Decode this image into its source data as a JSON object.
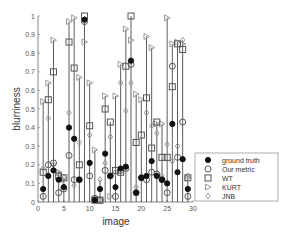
{
  "chart_data": {
    "type": "scatter",
    "title": "",
    "xlabel": "image",
    "ylabel": "blurriness",
    "xlim": [
      0,
      30
    ],
    "ylim": [
      0,
      1
    ],
    "xticks": [
      0,
      5,
      10,
      15,
      20,
      25,
      30
    ],
    "yticks": [
      0,
      0.1,
      0.2,
      0.3,
      0.4,
      0.5,
      0.6,
      0.7,
      0.8,
      0.9,
      1
    ],
    "grid": false,
    "legend_position": "lower right",
    "x": [
      1,
      2,
      3,
      4,
      5,
      6,
      7,
      8,
      9,
      10,
      11,
      12,
      13,
      14,
      15,
      16,
      17,
      18,
      19,
      20,
      21,
      22,
      23,
      24,
      25,
      26,
      27,
      28,
      29
    ],
    "series": [
      {
        "name": "ground truth",
        "marker": "filled-circle",
        "values": [
          0.07,
          0.14,
          0.17,
          0.12,
          0.08,
          0.4,
          0.34,
          0.12,
          0.98,
          0.21,
          0.01,
          0.07,
          0.26,
          0.14,
          0.08,
          0.18,
          0.19,
          0.76,
          0.05,
          0.13,
          0.14,
          0.22,
          0.14,
          0.12,
          0.1,
          0.42,
          0.16,
          0.23,
          0.07
        ]
      },
      {
        "name": "Our metric",
        "marker": "open-circle",
        "values": [
          0.03,
          0.2,
          0.21,
          0.05,
          0.07,
          0.25,
          0.12,
          0.12,
          0.97,
          0.14,
          0.02,
          0.01,
          0.17,
          0.14,
          0.03,
          0.17,
          0.18,
          0.74,
          0.05,
          0.13,
          0.12,
          0.16,
          0.15,
          0.12,
          0.05,
          0.73,
          0.24,
          0.43,
          0.03
        ]
      },
      {
        "name": "WT",
        "marker": "square",
        "values": [
          0.16,
          0.55,
          0.7,
          0.14,
          0.13,
          0.86,
          0.72,
          0.2,
          1.0,
          0.41,
          0.01,
          0.01,
          0.5,
          0.43,
          0.17,
          0.16,
          0.73,
          1.0,
          0.32,
          0.36,
          0.56,
          0.29,
          0.43,
          0.24,
          0.24,
          0.62,
          0.85,
          0.82,
          0.13
        ]
      },
      {
        "name": "KURT",
        "marker": "triangle-right",
        "values": [
          0.54,
          0.64,
          0.87,
          0.16,
          0.12,
          0.97,
          0.99,
          0.67,
          0.86,
          0.64,
          0.28,
          0.01,
          0.57,
          0.03,
          0.57,
          0.74,
          0.93,
          0.87,
          0.58,
          0.55,
          0.89,
          0.83,
          0.42,
          0.42,
          0.99,
          0.85,
          0.86,
          0.85,
          0.13
        ]
      },
      {
        "name": "JNB",
        "marker": "open-diamond",
        "values": [
          0.18,
          0.45,
          0.2,
          0.15,
          0.13,
          0.48,
          0.09,
          0.32,
          0.98,
          0.36,
          0.02,
          0.12,
          0.21,
          0.35,
          0.16,
          0.64,
          0.49,
          0.64,
          0.08,
          0.14,
          0.48,
          0.41,
          0.37,
          0.14,
          0.31,
          0.22,
          0.3,
          0.87,
          0.14
        ]
      }
    ]
  },
  "legend": {
    "items": [
      {
        "label": "ground truth",
        "marker": "filled-circle"
      },
      {
        "label": "Our metric",
        "marker": "open-circle"
      },
      {
        "label": "WT",
        "marker": "square"
      },
      {
        "label": "KURT",
        "marker": "triangle-right"
      },
      {
        "label": "JNB",
        "marker": "open-diamond"
      }
    ]
  },
  "colors": {
    "axis": "#888888",
    "stem": "#333333",
    "marker_stroke": "#555555",
    "filled": "#111111",
    "light": "#999999"
  }
}
